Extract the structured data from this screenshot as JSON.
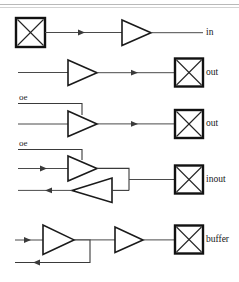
{
  "figure": {
    "background": "#ffffff",
    "width": 239,
    "height": 282,
    "line_color": "#3a3a3a",
    "gate_color": "#1a1a1a",
    "pad_color": "#111111",
    "text_color": "#171717"
  },
  "rows": [
    {
      "id": "in",
      "label": "in",
      "description": "input pad driving a buffer",
      "pad_side": "left",
      "gates": 1
    },
    {
      "id": "out",
      "label": "out",
      "description": "buffer driving an output pad",
      "pad_side": "right",
      "gates": 1
    },
    {
      "id": "out-tristate",
      "label": "out",
      "control_label": "oe",
      "description": "tristate buffer with output enable driving an output pad",
      "pad_side": "right",
      "gates": 1
    },
    {
      "id": "inout",
      "label": "inout",
      "control_label": "oe",
      "description": "bidirectional pad: tristate output driver plus input buffer",
      "pad_side": "right",
      "gates": 2
    },
    {
      "id": "buffer",
      "label": "buffer",
      "description": "buffer with feedback branch driving a pad",
      "pad_side": "right",
      "gates": 2
    }
  ],
  "labels": {
    "in": "in",
    "out_plain": "out",
    "out_tristate": "out",
    "inout": "inout",
    "buffer": "buffer",
    "oe_upper": "oe",
    "oe_lower": "oe"
  }
}
